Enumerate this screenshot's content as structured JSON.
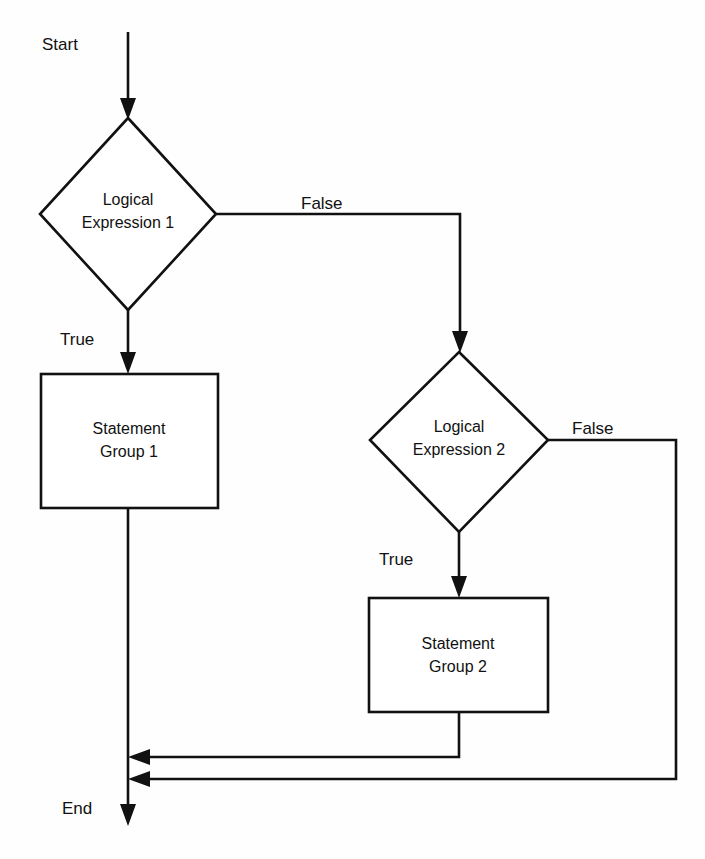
{
  "diagram": {
    "type": "flowchart",
    "background_color": "#fefefe",
    "line_color": "#111111",
    "shape_fill": "#ffffff"
  },
  "terminals": {
    "start_label": "Start",
    "end_label": "End"
  },
  "nodes": [
    {
      "id": "decision1",
      "shape": "diamond",
      "line1": "Logical",
      "line2": "Expression 1",
      "center_x": 128,
      "center_y": 214
    },
    {
      "id": "process1",
      "shape": "rectangle",
      "line1": "Statement",
      "line2": "Group 1",
      "center_x": 129,
      "center_y": 440
    },
    {
      "id": "decision2",
      "shape": "diamond",
      "line1": "Logical",
      "line2": "Expression 2",
      "center_x": 459,
      "center_y": 440
    },
    {
      "id": "process2",
      "shape": "rectangle",
      "line1": "Statement",
      "line2": "Group 2",
      "center_x": 458,
      "center_y": 655
    }
  ],
  "edge_labels": {
    "d1_false": "False",
    "d1_true": "True",
    "d2_false": "False",
    "d2_true": "True"
  },
  "edges": [
    {
      "id": "start-to-d1",
      "from": "start",
      "to": "decision1",
      "label": ""
    },
    {
      "id": "d1-false-to-d2",
      "from": "decision1",
      "to": "decision2",
      "label": "False"
    },
    {
      "id": "d1-true-to-p1",
      "from": "decision1",
      "to": "process1",
      "label": "True"
    },
    {
      "id": "d2-true-to-p2",
      "from": "decision2",
      "to": "process2",
      "label": "True"
    },
    {
      "id": "d2-false-to-end",
      "from": "decision2",
      "to": "end",
      "label": "False"
    },
    {
      "id": "p2-to-end",
      "from": "process2",
      "to": "end",
      "label": ""
    },
    {
      "id": "p1-to-end",
      "from": "process1",
      "to": "end",
      "label": ""
    }
  ]
}
